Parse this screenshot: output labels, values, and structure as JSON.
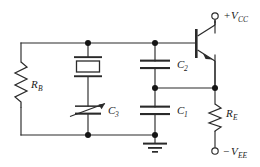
{
  "diagram": {
    "type": "schematic",
    "line_color": "#2a2a2a",
    "background": "#ffffff",
    "text_color": "#1a1a1a"
  },
  "labels": {
    "rb": {
      "symbol": "R",
      "subscript": "B"
    },
    "re": {
      "symbol": "R",
      "subscript": "E"
    },
    "c1": {
      "symbol": "C",
      "subscript": "1"
    },
    "c2": {
      "symbol": "C",
      "subscript": "2"
    },
    "c3": {
      "symbol": "C",
      "subscript": "3"
    },
    "vcc": {
      "sign": "+",
      "symbol": "V",
      "subscript": "CC"
    },
    "vee": {
      "sign": "−",
      "symbol": "V",
      "subscript": "EE"
    }
  },
  "components": [
    {
      "name": "resistor-rb",
      "kind": "resistor",
      "label": "R_B",
      "orientation": "vertical"
    },
    {
      "name": "resistor-re",
      "kind": "resistor",
      "label": "R_E",
      "orientation": "vertical"
    },
    {
      "name": "capacitor-c1",
      "kind": "capacitor",
      "label": "C_1",
      "orientation": "vertical"
    },
    {
      "name": "capacitor-c2",
      "kind": "capacitor",
      "label": "C_2",
      "orientation": "vertical"
    },
    {
      "name": "capacitor-c3",
      "kind": "variable-capacitor",
      "label": "C_3",
      "orientation": "vertical"
    },
    {
      "name": "crystal",
      "kind": "quartz-crystal",
      "label": "",
      "orientation": "vertical"
    },
    {
      "name": "transistor-q1",
      "kind": "npn-bjt",
      "label": "",
      "orientation": "right"
    },
    {
      "name": "ground",
      "kind": "earth-ground",
      "label": ""
    },
    {
      "name": "terminal-vcc",
      "kind": "open-terminal",
      "label": "+V_CC"
    },
    {
      "name": "terminal-vee",
      "kind": "open-terminal",
      "label": "-V_EE"
    }
  ],
  "nodes": [
    {
      "name": "node-top-crystal",
      "x": 88,
      "y": 43
    },
    {
      "name": "node-top-c2",
      "x": 155,
      "y": 43
    },
    {
      "name": "node-emitter",
      "x": 155,
      "y": 88
    },
    {
      "name": "node-re-top",
      "x": 215,
      "y": 88
    },
    {
      "name": "node-bottom-left",
      "x": 88,
      "y": 135
    },
    {
      "name": "node-ground",
      "x": 155,
      "y": 135
    }
  ]
}
